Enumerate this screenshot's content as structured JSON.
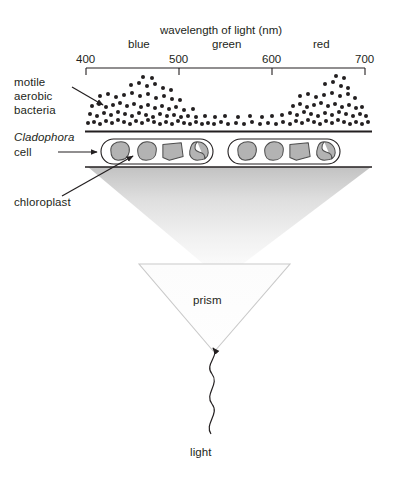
{
  "diagram": {
    "title_fragment_top": "",
    "axis": {
      "title": "wavelength of light (nm)",
      "ticks": [
        {
          "value": "400",
          "x": 86
        },
        {
          "value": "500",
          "x": 179
        },
        {
          "value": "600",
          "x": 272
        },
        {
          "value": "700",
          "x": 365
        }
      ],
      "bands": [
        {
          "label": "blue",
          "x": 143
        },
        {
          "label": "green",
          "x": 228
        },
        {
          "label": "red",
          "x": 322
        }
      ],
      "range_nm": [
        400,
        700
      ]
    },
    "labels": {
      "bacteria": "motile\naerobic\nbacteria",
      "bacteria_line1": "motile",
      "bacteria_line2": "aerobic",
      "bacteria_line3": "bacteria",
      "organism_italic": "Cladophora",
      "organism_line2": "cell",
      "chloroplast": "chloroplast",
      "prism": "prism",
      "light": "light"
    },
    "colors": {
      "ink": "#231f20",
      "chloroplast_fill": "#b3b3b3",
      "chloroplast_stroke": "#4d4d4d",
      "beam_top": "#c4c4c4",
      "beam_bottom": "#fbfbfb",
      "prism_stroke": "#c9c9c9",
      "background": "#ffffff"
    },
    "bacteria_distribution": {
      "description": "Motile aerobic bacteria accumulate where oxygen output is highest; dense clusters under blue and red light, sparse under green.",
      "peaks_nm": [
        450,
        670
      ],
      "trough_nm": 550,
      "dots": [
        [
          88,
          123
        ],
        [
          94,
          122
        ],
        [
          100,
          124
        ],
        [
          106,
          121
        ],
        [
          112,
          123
        ],
        [
          118,
          120
        ],
        [
          124,
          122
        ],
        [
          130,
          124
        ],
        [
          136,
          121
        ],
        [
          142,
          123
        ],
        [
          148,
          120
        ],
        [
          154,
          122
        ],
        [
          160,
          124
        ],
        [
          166,
          122
        ],
        [
          172,
          124
        ],
        [
          178,
          121
        ],
        [
          184,
          123
        ],
        [
          190,
          124
        ],
        [
          196,
          122
        ],
        [
          202,
          124
        ],
        [
          208,
          123
        ],
        [
          214,
          124
        ],
        [
          221,
          122
        ],
        [
          228,
          124
        ],
        [
          236,
          123
        ],
        [
          244,
          124
        ],
        [
          252,
          122
        ],
        [
          260,
          124
        ],
        [
          268,
          123
        ],
        [
          276,
          124
        ],
        [
          283,
          122
        ],
        [
          290,
          124
        ],
        [
          296,
          121
        ],
        [
          302,
          123
        ],
        [
          308,
          120
        ],
        [
          314,
          122
        ],
        [
          320,
          124
        ],
        [
          326,
          121
        ],
        [
          332,
          123
        ],
        [
          338,
          120
        ],
        [
          344,
          122
        ],
        [
          350,
          124
        ],
        [
          356,
          122
        ],
        [
          362,
          124
        ],
        [
          368,
          122
        ],
        [
          90,
          114
        ],
        [
          97,
          116
        ],
        [
          104,
          113
        ],
        [
          111,
          115
        ],
        [
          118,
          112
        ],
        [
          125,
          114
        ],
        [
          132,
          116
        ],
        [
          139,
          113
        ],
        [
          146,
          115
        ],
        [
          153,
          117
        ],
        [
          160,
          114
        ],
        [
          167,
          116
        ],
        [
          174,
          115
        ],
        [
          181,
          117
        ],
        [
          188,
          116
        ],
        [
          196,
          117
        ],
        [
          205,
          116
        ],
        [
          215,
          117
        ],
        [
          225,
          116
        ],
        [
          238,
          117
        ],
        [
          250,
          116
        ],
        [
          262,
          117
        ],
        [
          272,
          116
        ],
        [
          282,
          115
        ],
        [
          290,
          113
        ],
        [
          297,
          115
        ],
        [
          304,
          112
        ],
        [
          311,
          114
        ],
        [
          318,
          116
        ],
        [
          325,
          113
        ],
        [
          332,
          115
        ],
        [
          339,
          112
        ],
        [
          346,
          114
        ],
        [
          353,
          116
        ],
        [
          360,
          114
        ],
        [
          366,
          116
        ],
        [
          92,
          106
        ],
        [
          99,
          104
        ],
        [
          106,
          107
        ],
        [
          113,
          105
        ],
        [
          120,
          103
        ],
        [
          127,
          106
        ],
        [
          134,
          104
        ],
        [
          141,
          107
        ],
        [
          148,
          105
        ],
        [
          155,
          108
        ],
        [
          162,
          106
        ],
        [
          169,
          109
        ],
        [
          176,
          107
        ],
        [
          184,
          110
        ],
        [
          193,
          109
        ],
        [
          293,
          106
        ],
        [
          300,
          104
        ],
        [
          307,
          107
        ],
        [
          314,
          105
        ],
        [
          321,
          103
        ],
        [
          328,
          106
        ],
        [
          335,
          104
        ],
        [
          342,
          107
        ],
        [
          349,
          105
        ],
        [
          356,
          108
        ],
        [
          362,
          107
        ],
        [
          100,
          96
        ],
        [
          108,
          94
        ],
        [
          116,
          97
        ],
        [
          124,
          95
        ],
        [
          132,
          93
        ],
        [
          140,
          96
        ],
        [
          148,
          94
        ],
        [
          156,
          98
        ],
        [
          164,
          96
        ],
        [
          172,
          99
        ],
        [
          180,
          100
        ],
        [
          300,
          96
        ],
        [
          308,
          94
        ],
        [
          316,
          97
        ],
        [
          324,
          95
        ],
        [
          332,
          93
        ],
        [
          340,
          96
        ],
        [
          348,
          94
        ],
        [
          355,
          98
        ],
        [
          131,
          85
        ],
        [
          139,
          83
        ],
        [
          147,
          86
        ],
        [
          155,
          84
        ],
        [
          163,
          88
        ],
        [
          171,
          90
        ],
        [
          325,
          84
        ],
        [
          333,
          82
        ],
        [
          341,
          86
        ],
        [
          348,
          88
        ],
        [
          143,
          77
        ],
        [
          152,
          78
        ],
        [
          336,
          76
        ],
        [
          344,
          78
        ]
      ]
    },
    "cells": [
      {
        "x": 101,
        "y": 139,
        "w": 112,
        "h": 25,
        "chloroplasts": [
          {
            "shape": "blob-a",
            "cx": 120,
            "cy": 151
          },
          {
            "shape": "blob-b",
            "cx": 147,
            "cy": 151
          },
          {
            "shape": "blob-c",
            "cx": 173,
            "cy": 151
          },
          {
            "shape": "blob-d",
            "cx": 199,
            "cy": 151
          }
        ]
      },
      {
        "x": 228,
        "y": 139,
        "w": 112,
        "h": 25,
        "chloroplasts": [
          {
            "shape": "blob-a",
            "cx": 247,
            "cy": 151
          },
          {
            "shape": "blob-b",
            "cx": 274,
            "cy": 151
          },
          {
            "shape": "blob-c",
            "cx": 300,
            "cy": 151
          },
          {
            "shape": "blob-d",
            "cx": 326,
            "cy": 151
          }
        ]
      }
    ]
  }
}
